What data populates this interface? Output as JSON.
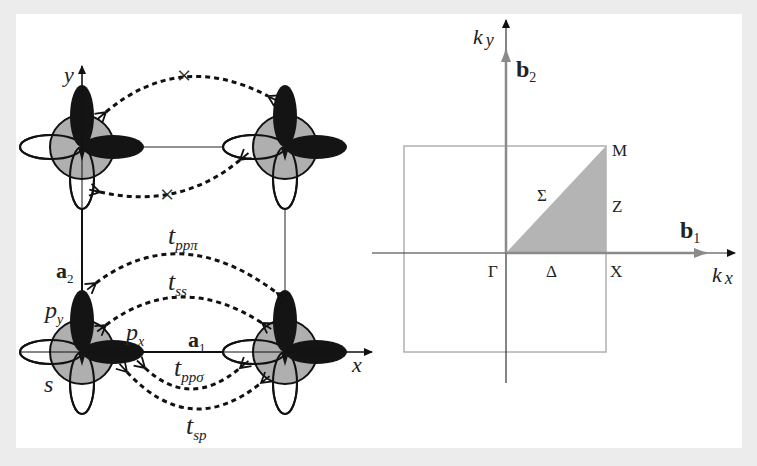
{
  "figure": {
    "left_panel": {
      "title": "Real-space square lattice with s, px, py orbitals",
      "axes": {
        "x_label": "x",
        "y_label": "y"
      },
      "lattice_vectors": {
        "a1": {
          "main": "a",
          "sub": "1"
        },
        "a2": {
          "main": "a",
          "sub": "2"
        }
      },
      "orbital_labels": {
        "s": "s",
        "px": {
          "main": "p",
          "sub": "x"
        },
        "py": {
          "main": "p",
          "sub": "y"
        }
      },
      "hoppings": [
        {
          "id": "tpppi",
          "main": "t",
          "sub": "ppπ"
        },
        {
          "id": "tss",
          "main": "t",
          "sub": "ss"
        },
        {
          "id": "tppsigma",
          "main": "t",
          "sub": "ppσ"
        },
        {
          "id": "tsp",
          "main": "t",
          "sub": "sp"
        }
      ],
      "forbidden_marks": [
        "×",
        "×"
      ]
    },
    "right_panel": {
      "title": "First Brillouin zone of square lattice",
      "axes": {
        "kx": {
          "main": "k",
          "sub": "x"
        },
        "ky": {
          "main": "k",
          "sub": "y"
        }
      },
      "reciprocal_vectors": {
        "b1": {
          "main": "b",
          "sub": "1"
        },
        "b2": {
          "main": "b",
          "sub": "2"
        }
      },
      "high_symmetry_points": {
        "gamma": "Γ",
        "x": "X",
        "m": "M"
      },
      "high_symmetry_lines": {
        "delta": "Δ",
        "z": "Z",
        "sigma": "Σ"
      }
    },
    "colors": {
      "background": "#ececec",
      "panel": "#ffffff",
      "lobe_dark": "#141414",
      "s_orbital": "#a8a8a8",
      "ibz_fill": "#b4b4b4",
      "bz_border": "#b0b0b0",
      "reciprocal_arrow": "#8a8a8a",
      "line": "#222222"
    }
  }
}
